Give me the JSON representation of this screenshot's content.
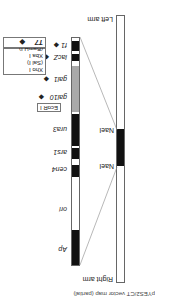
{
  "arms": {
    "left": "Left arm",
    "right": "Right arm"
  },
  "nae": [
    "NaeI",
    "NaeI"
  ],
  "features": {
    "ap": "Ap",
    "ori": "ori",
    "cen4": "cen4",
    "ars1": "ars1",
    "ura3": "ura3",
    "ecor1": "EcoR I",
    "gal10": "gal10",
    "gal1": "gal1",
    "lacz": "lacZ",
    "f1": "f1"
  },
  "sites_box": [
    "Xho I",
    "(Sal I)",
    "Xba I",
    "(BamH I)"
  ],
  "t7": "T7",
  "caption": "pYES2/CT vector map (partial)",
  "colors": {
    "black": "#111111",
    "gray": "#a9a9a9",
    "line": "#666666"
  }
}
